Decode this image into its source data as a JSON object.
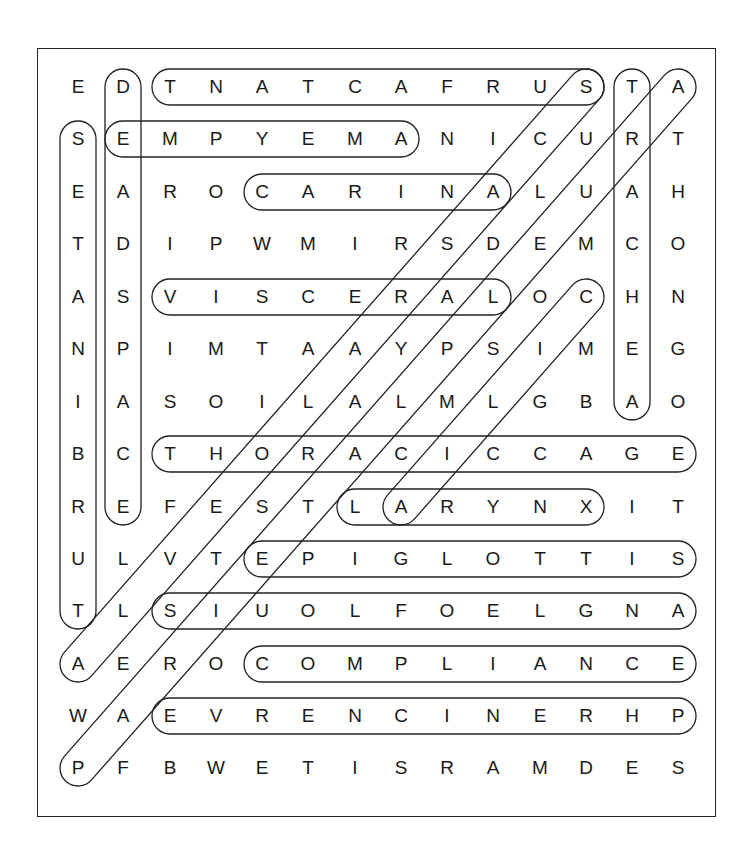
{
  "puzzle": {
    "type": "word-search",
    "rows": 14,
    "cols": 14,
    "grid": [
      [
        "E",
        "D",
        "T",
        "N",
        "A",
        "T",
        "C",
        "A",
        "F",
        "R",
        "U",
        "S",
        "T",
        "A"
      ],
      [
        "S",
        "E",
        "M",
        "P",
        "Y",
        "E",
        "M",
        "A",
        "N",
        "I",
        "C",
        "U",
        "R",
        "T"
      ],
      [
        "E",
        "A",
        "R",
        "O",
        "C",
        "A",
        "R",
        "I",
        "N",
        "A",
        "L",
        "U",
        "A",
        "H"
      ],
      [
        "T",
        "D",
        "I",
        "P",
        "W",
        "M",
        "I",
        "R",
        "S",
        "D",
        "E",
        "M",
        "C",
        "O"
      ],
      [
        "A",
        "S",
        "V",
        "I",
        "S",
        "C",
        "E",
        "R",
        "A",
        "L",
        "O",
        "C",
        "H",
        "N"
      ],
      [
        "N",
        "P",
        "I",
        "M",
        "T",
        "A",
        "A",
        "Y",
        "P",
        "S",
        "I",
        "M",
        "E",
        "G"
      ],
      [
        "I",
        "A",
        "S",
        "O",
        "I",
        "L",
        "A",
        "L",
        "M",
        "L",
        "G",
        "B",
        "A",
        "O"
      ],
      [
        "B",
        "C",
        "T",
        "H",
        "O",
        "R",
        "A",
        "C",
        "I",
        "C",
        "C",
        "A",
        "G",
        "E"
      ],
      [
        "R",
        "E",
        "F",
        "E",
        "S",
        "T",
        "L",
        "A",
        "R",
        "Y",
        "N",
        "X",
        "I",
        "T"
      ],
      [
        "U",
        "L",
        "V",
        "T",
        "E",
        "P",
        "I",
        "G",
        "L",
        "O",
        "T",
        "T",
        "I",
        "S"
      ],
      [
        "T",
        "L",
        "S",
        "I",
        "U",
        "O",
        "L",
        "F",
        "O",
        "E",
        "L",
        "G",
        "N",
        "A"
      ],
      [
        "A",
        "E",
        "R",
        "O",
        "C",
        "O",
        "M",
        "P",
        "L",
        "I",
        "A",
        "N",
        "C",
        "E"
      ],
      [
        "W",
        "A",
        "E",
        "V",
        "R",
        "E",
        "N",
        "C",
        "I",
        "N",
        "E",
        "R",
        "H",
        "P"
      ],
      [
        "P",
        "F",
        "B",
        "W",
        "E",
        "T",
        "I",
        "S",
        "R",
        "A",
        "M",
        "D",
        "E",
        "S"
      ]
    ],
    "found_marks": [
      {
        "dir": "h",
        "row": 0,
        "c1": 2,
        "c2": 11,
        "letters": "TNATCAFRUS"
      },
      {
        "dir": "h",
        "row": 1,
        "c1": 1,
        "c2": 7,
        "letters": "EMPYEMA"
      },
      {
        "dir": "h",
        "row": 2,
        "c1": 4,
        "c2": 9,
        "letters": "CARINA"
      },
      {
        "dir": "h",
        "row": 4,
        "c1": 2,
        "c2": 9,
        "letters": "VISCERAL"
      },
      {
        "dir": "h",
        "row": 7,
        "c1": 2,
        "c2": 13,
        "letters": "THORACICCAGE"
      },
      {
        "dir": "h",
        "row": 8,
        "c1": 6,
        "c2": 11,
        "letters": "LARYNX"
      },
      {
        "dir": "h",
        "row": 9,
        "c1": 4,
        "c2": 13,
        "letters": "EPIGLOTTIS"
      },
      {
        "dir": "h",
        "row": 10,
        "c1": 2,
        "c2": 13,
        "letters": "SIUOLFOELGNA"
      },
      {
        "dir": "h",
        "row": 11,
        "c1": 4,
        "c2": 13,
        "letters": "COMPLIANCE"
      },
      {
        "dir": "h",
        "row": 12,
        "c1": 2,
        "c2": 13,
        "letters": "EVRENCINERHP"
      },
      {
        "dir": "v",
        "col": 0,
        "r1": 1,
        "r2": 10,
        "letters": "SETANIBRUT"
      },
      {
        "dir": "v",
        "col": 1,
        "r1": 0,
        "r2": 8,
        "letters": "DEADSPACE"
      },
      {
        "dir": "v",
        "col": 12,
        "r1": 0,
        "r2": 6,
        "letters": "TRACHEA"
      },
      {
        "dir": "d",
        "r1": 0,
        "c1": 11,
        "r2": 11,
        "c2": 0
      },
      {
        "dir": "d",
        "r1": 0,
        "c1": 13,
        "r2": 13,
        "c2": 0
      },
      {
        "dir": "d",
        "r1": 4,
        "c1": 11,
        "r2": 8,
        "c2": 7
      }
    ]
  },
  "layout": {
    "col_x": [
      78,
      123,
      170,
      216,
      262,
      308,
      355,
      401,
      447,
      493,
      540,
      586,
      632,
      678
    ],
    "row_y": [
      87,
      139,
      192,
      244,
      297,
      349,
      402,
      454,
      507,
      559,
      611,
      664,
      716,
      768
    ],
    "stroke_color": "#222222",
    "text_color": "#1a1a1a"
  }
}
